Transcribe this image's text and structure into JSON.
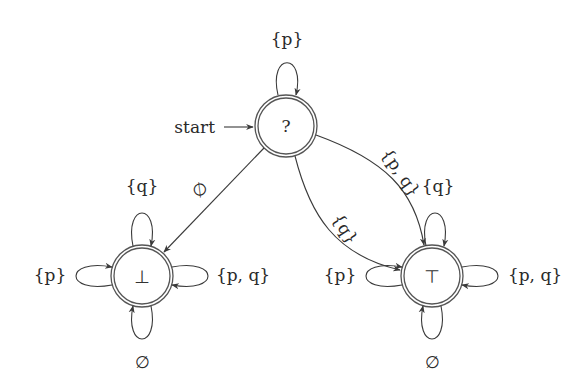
{
  "diagram": {
    "type": "automaton",
    "start_label": "start",
    "states": [
      {
        "id": "unknown",
        "label": "?",
        "accepting": true,
        "initial": true
      },
      {
        "id": "bottom",
        "label": "⊥",
        "accepting": true,
        "initial": false
      },
      {
        "id": "top",
        "label": "⊤",
        "accepting": true,
        "initial": false
      }
    ],
    "transitions": [
      {
        "from": "unknown",
        "to": "unknown",
        "label": "{p}"
      },
      {
        "from": "unknown",
        "to": "bottom",
        "label": "∅"
      },
      {
        "from": "unknown",
        "to": "top",
        "label": "{q}"
      },
      {
        "from": "unknown",
        "to": "top",
        "label": "{p, q}"
      },
      {
        "from": "bottom",
        "to": "bottom",
        "label": "{q}",
        "position": "top"
      },
      {
        "from": "bottom",
        "to": "bottom",
        "label": "{p}",
        "position": "left"
      },
      {
        "from": "bottom",
        "to": "bottom",
        "label": "{p, q}",
        "position": "right"
      },
      {
        "from": "bottom",
        "to": "bottom",
        "label": "∅",
        "position": "bottom"
      },
      {
        "from": "top",
        "to": "top",
        "label": "{q}",
        "position": "top"
      },
      {
        "from": "top",
        "to": "top",
        "label": "{p}",
        "position": "left"
      },
      {
        "from": "top",
        "to": "top",
        "label": "{p, q}",
        "position": "right"
      },
      {
        "from": "top",
        "to": "top",
        "label": "∅",
        "position": "bottom"
      }
    ]
  },
  "labels": {
    "start": "start",
    "s_unknown": "?",
    "s_bottom": "⊥",
    "s_top": "⊤",
    "unknown_loop": "{p}",
    "edge_to_bottom": "∅",
    "edge_to_top_q": "{q}",
    "edge_to_top_pq": "{p, q}",
    "bottom_loop_top": "{q}",
    "bottom_loop_left": "{p}",
    "bottom_loop_right": "{p, q}",
    "bottom_loop_bottom": "∅",
    "top_loop_top": "{q}",
    "top_loop_left": "{p}",
    "top_loop_right": "{p, q}",
    "top_loop_bottom": "∅"
  },
  "colors": {
    "stroke": "#3a3a3a",
    "text": "#2a2a2a",
    "background": "#ffffff"
  }
}
